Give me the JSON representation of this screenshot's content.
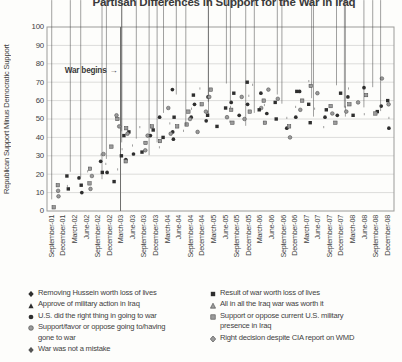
{
  "chart_data": {
    "type": "scatter",
    "title": "Partisan Differences in Support for the War in Iraq",
    "ylabel": "Republican Support Minus Democratic Support",
    "xlabel": "",
    "ylim": [
      0,
      100
    ],
    "y_ticks": [
      0,
      10,
      20,
      30,
      40,
      50,
      60,
      70,
      80,
      90,
      100
    ],
    "grid": "horizontal",
    "legend_position": "bottom",
    "annotation": {
      "label": "War begins",
      "arrow": "→",
      "x_tick": "March-03",
      "y_value": 76
    },
    "colors": {
      "text": "#3f3f3f",
      "grid": "#dcdcda",
      "axis": "#9b9b99",
      "war_line": "#6e6e6c",
      "dark_marker": "#2e2e2e",
      "gray_marker": "#9b9b9b"
    },
    "series": [
      {
        "label": "Removing Hussein worth loss of lives",
        "marker": "diamond",
        "fill": "#2e2e2e",
        "stroke": "#2e2e2e"
      },
      {
        "label": "Approve of military action in Iraq",
        "marker": "triangle",
        "fill": "#2e2e2e",
        "stroke": "#2e2e2e"
      },
      {
        "label": "U.S. did the right thing in going to war",
        "marker": "circle",
        "fill": "#2e2e2e",
        "stroke": "#2e2e2e"
      },
      {
        "label": "Support/favor or oppose going to/having gone to war",
        "marker": "circle",
        "fill": "#9b9b9b",
        "stroke": "#454545"
      },
      {
        "label": "War was not a mistake",
        "marker": "diamond",
        "fill": "#555555",
        "stroke": "#2e2e2e"
      },
      {
        "label": "Result of war worth loss of lives",
        "marker": "square",
        "fill": "#2e2e2e",
        "stroke": "#2e2e2e"
      },
      {
        "label": "All in all the Iraq war was worth it",
        "marker": "triangle",
        "fill": "#9b9b9b",
        "stroke": "#454545"
      },
      {
        "label": "Support or oppose current U.S. military presence in Iraq",
        "marker": "square",
        "fill": "#9b9b9b",
        "stroke": "#454545"
      },
      {
        "label": "Right decision despite CIA report on WMD",
        "marker": "diamond",
        "fill": "#9b9b9b",
        "stroke": "#454545"
      }
    ],
    "legend_columns": [
      [
        0,
        1,
        2,
        3,
        4
      ],
      [
        5,
        6,
        7,
        8
      ]
    ],
    "clusters": [
      {
        "label": "September-01",
        "values": [
          1,
          3,
          5,
          8,
          2
        ]
      },
      {
        "label": "December-01",
        "values": [
          9,
          12,
          15,
          18,
          20,
          11,
          14
        ]
      },
      {
        "label": "March-02",
        "values": [
          10,
          13,
          16,
          19,
          22,
          12,
          17
        ]
      },
      {
        "label": "June-02",
        "values": [
          12,
          15,
          18,
          21,
          24,
          14,
          19
        ]
      },
      {
        "label": "September-02",
        "values": [
          13,
          16,
          19,
          23,
          27,
          30,
          17,
          21
        ]
      },
      {
        "label": "December-02",
        "values": [
          16,
          19,
          23,
          27,
          31,
          35,
          21,
          25,
          29
        ]
      },
      {
        "label": "March-03",
        "values": [
          22,
          26,
          30,
          34,
          38,
          42,
          46,
          50,
          28,
          33,
          37,
          41,
          45,
          25,
          36,
          52
        ]
      },
      {
        "label": "June-03",
        "values": [
          27,
          31,
          35,
          39,
          43,
          30,
          34,
          38,
          42,
          45
        ]
      },
      {
        "label": "September-03",
        "values": [
          29,
          33,
          37,
          41,
          45,
          49,
          32,
          36,
          40
        ]
      },
      {
        "label": "December-03",
        "values": [
          26,
          31,
          36,
          41,
          46,
          51,
          34,
          39,
          44
        ]
      },
      {
        "label": "March-04",
        "values": [
          36,
          40,
          44,
          48,
          52,
          56,
          38,
          43,
          47,
          58
        ]
      },
      {
        "label": "June-04",
        "values": [
          39,
          43,
          47,
          51,
          55,
          59,
          62,
          42,
          46,
          66
        ]
      },
      {
        "label": "September-04",
        "values": [
          43,
          47,
          51,
          55,
          59,
          63,
          67,
          78,
          45,
          50,
          54,
          58
        ]
      },
      {
        "label": "December-04",
        "values": [
          46,
          50,
          54,
          58,
          62,
          66,
          48,
          52,
          56,
          60
        ]
      },
      {
        "label": "March-05",
        "values": [
          46,
          50,
          54,
          58,
          62,
          66,
          49,
          53,
          57
        ]
      },
      {
        "label": "June-05",
        "values": [
          48,
          52,
          56,
          60,
          64,
          68,
          51,
          55,
          59
        ]
      },
      {
        "label": "September-05",
        "values": [
          48,
          52,
          56,
          60,
          64,
          50,
          54,
          58,
          62
        ]
      },
      {
        "label": "December-05",
        "values": [
          45,
          50,
          54,
          58,
          62,
          66,
          70,
          52,
          56
        ]
      },
      {
        "label": "March-06",
        "values": [
          38,
          47,
          52,
          56,
          60,
          64,
          68,
          50,
          55
        ]
      },
      {
        "label": "June-06",
        "values": [
          39,
          50,
          54,
          58,
          62,
          66,
          48,
          53,
          57
        ]
      },
      {
        "label": "September-06",
        "values": [
          45,
          50,
          55,
          59,
          63,
          52,
          57,
          61
        ]
      },
      {
        "label": "December-06",
        "values": [
          40,
          46,
          51,
          56,
          61,
          65,
          49,
          54
        ]
      },
      {
        "label": "March-07",
        "values": [
          45,
          50,
          55,
          60,
          65,
          70,
          53,
          58
        ]
      },
      {
        "label": "June-07",
        "values": [
          48,
          52,
          56,
          60,
          64,
          68,
          51,
          55
        ]
      },
      {
        "label": "September-07",
        "values": [
          45,
          50,
          55,
          59,
          63,
          67,
          53,
          57
        ]
      },
      {
        "label": "December-07",
        "values": [
          48,
          52,
          56,
          60,
          64,
          72,
          51,
          55
        ]
      },
      {
        "label": "March-08",
        "values": [
          50,
          54,
          58,
          62,
          66,
          70,
          52,
          56
        ]
      },
      {
        "label": "June-08",
        "values": [
          45,
          50,
          55,
          59,
          63,
          67,
          52,
          57
        ]
      },
      {
        "label": "September-08",
        "values": [
          50,
          54,
          58,
          62,
          66,
          72,
          53,
          57
        ]
      },
      {
        "label": "December-08",
        "values": [
          45,
          50,
          55,
          60,
          64,
          68,
          53,
          58
        ]
      }
    ]
  }
}
